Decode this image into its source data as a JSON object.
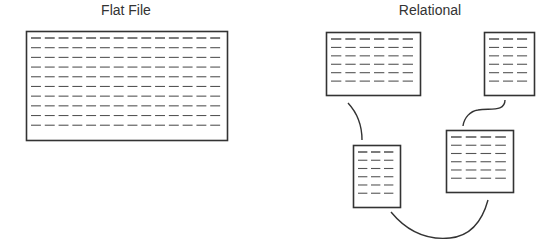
{
  "diagram": {
    "left_panel": {
      "title": "Flat File",
      "table": {
        "rows": 10,
        "cols": 14,
        "x": 26,
        "y": 31,
        "w": 201,
        "h": 109
      }
    },
    "right_panel": {
      "title": "Relational",
      "tables": [
        {
          "id": "top-left",
          "rows": 6,
          "cols": 6,
          "x": 326,
          "y": 32,
          "w": 94,
          "h": 63
        },
        {
          "id": "top-right",
          "rows": 6,
          "cols": 3,
          "x": 484,
          "y": 32,
          "w": 50,
          "h": 63
        },
        {
          "id": "bottom-left",
          "rows": 6,
          "cols": 3,
          "x": 353,
          "y": 145,
          "w": 47,
          "h": 62
        },
        {
          "id": "bottom-right",
          "rows": 6,
          "cols": 4,
          "x": 446,
          "y": 130,
          "w": 67,
          "h": 62
        }
      ],
      "connectors": [
        {
          "from": "top-left",
          "to": "bottom-left",
          "path": "M 348 103 Q 362 118 362 140"
        },
        {
          "from": "top-right",
          "to": "bottom-right",
          "path": "M 505 100 C 505 112 490 108 478 110 C 470 111 464 118 463 126"
        },
        {
          "from": "bottom-left",
          "to": "bottom-right",
          "path": "M 391 212 C 410 235 430 240 450 238 C 470 236 482 222 488 200"
        }
      ]
    },
    "colors": {
      "border": "#333333",
      "dash": "#555555",
      "curve": "#333333",
      "title": "#333333"
    }
  }
}
